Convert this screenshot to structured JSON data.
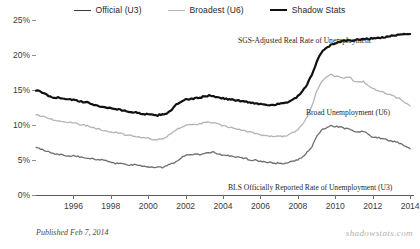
{
  "legend": {
    "items": [
      {
        "label": "Official (U3)",
        "color": "#3a3a3a",
        "key": "u3"
      },
      {
        "label": "Broadest (U6)",
        "color": "#b4b4b4",
        "key": "u6"
      },
      {
        "label": "Shadow Stats",
        "color": "#111111",
        "key": "sgs"
      }
    ]
  },
  "annotations": {
    "sgs": "SGS-Adjusted Real Rate of Unemployment",
    "u6": "Broad Unemployment (U6)",
    "u3": "BLS Officially Reported Rate of Unemployment (U3)"
  },
  "footer": {
    "published": "Published  Feb  7, 2014",
    "watermark": "shadowstats.com"
  },
  "chart_data": {
    "type": "line",
    "title": "",
    "xlabel": "",
    "ylabel": "",
    "grid": false,
    "legend_position": "top-center",
    "xlim": [
      1994.0,
      2014.1
    ],
    "ylim": [
      0,
      25
    ],
    "ytick_values": [
      0,
      5,
      10,
      15,
      20,
      25
    ],
    "ytick_labels": [
      "0%",
      "5%",
      "10%",
      "15%",
      "20%",
      "25%"
    ],
    "xtick_values": [
      1996,
      1998,
      2000,
      2002,
      2004,
      2006,
      2008,
      2010,
      2012,
      2014
    ],
    "xtick_labels": [
      "1996",
      "1998",
      "2000",
      "2002",
      "2004",
      "2006",
      "2008",
      "2010",
      "2012",
      "2014"
    ],
    "x": [
      1994.0,
      1994.25,
      1994.5,
      1994.75,
      1995.0,
      1995.25,
      1995.5,
      1995.75,
      1996.0,
      1996.25,
      1996.5,
      1996.75,
      1997.0,
      1997.25,
      1997.5,
      1997.75,
      1998.0,
      1998.25,
      1998.5,
      1998.75,
      1999.0,
      1999.25,
      1999.5,
      1999.75,
      2000.0,
      2000.25,
      2000.5,
      2000.75,
      2001.0,
      2001.25,
      2001.5,
      2001.75,
      2002.0,
      2002.25,
      2002.5,
      2002.75,
      2003.0,
      2003.25,
      2003.5,
      2003.75,
      2004.0,
      2004.25,
      2004.5,
      2004.75,
      2005.0,
      2005.25,
      2005.5,
      2005.75,
      2006.0,
      2006.25,
      2006.5,
      2006.75,
      2007.0,
      2007.25,
      2007.5,
      2007.75,
      2008.0,
      2008.25,
      2008.5,
      2008.75,
      2009.0,
      2009.25,
      2009.5,
      2009.75,
      2010.0,
      2010.25,
      2010.5,
      2010.75,
      2011.0,
      2011.25,
      2011.5,
      2011.75,
      2012.0,
      2012.25,
      2012.5,
      2012.75,
      2013.0,
      2013.25,
      2013.5,
      2013.75,
      2014.0
    ],
    "series": [
      {
        "name": "Shadow Stats",
        "label": "SGS-Adjusted Real Rate of Unemployment",
        "color": "#111111",
        "width": 2.2,
        "values": [
          15.0,
          14.7,
          14.4,
          14.1,
          13.9,
          13.9,
          13.8,
          13.7,
          13.6,
          13.4,
          13.3,
          13.2,
          13.0,
          12.8,
          12.6,
          12.5,
          12.4,
          12.3,
          12.2,
          12.0,
          11.9,
          11.8,
          11.7,
          11.6,
          11.5,
          11.4,
          11.4,
          11.5,
          11.7,
          12.2,
          12.9,
          13.3,
          13.6,
          13.7,
          13.8,
          13.9,
          14.1,
          14.2,
          14.1,
          14.0,
          13.8,
          13.7,
          13.6,
          13.5,
          13.4,
          13.3,
          13.2,
          13.1,
          13.0,
          12.9,
          12.9,
          12.9,
          13.0,
          13.1,
          13.3,
          13.6,
          14.1,
          14.8,
          15.8,
          17.2,
          19.0,
          20.3,
          21.0,
          21.4,
          21.7,
          21.9,
          22.0,
          22.1,
          22.1,
          22.2,
          22.3,
          22.3,
          22.4,
          22.4,
          22.5,
          22.6,
          22.7,
          22.8,
          22.9,
          23.0,
          23.0
        ]
      },
      {
        "name": "Broadest (U6)",
        "label": "Broad Unemployment (U6)",
        "color": "#b4b4b4",
        "width": 1.3,
        "values": [
          11.5,
          11.3,
          11.1,
          10.9,
          10.7,
          10.6,
          10.5,
          10.4,
          10.3,
          10.1,
          10.0,
          9.9,
          9.7,
          9.5,
          9.3,
          9.2,
          9.0,
          8.9,
          8.8,
          8.6,
          8.5,
          8.4,
          8.3,
          8.2,
          8.1,
          7.9,
          7.9,
          8.0,
          8.3,
          8.9,
          9.4,
          9.7,
          9.9,
          10.0,
          10.1,
          10.2,
          10.3,
          10.4,
          10.3,
          10.1,
          9.9,
          9.7,
          9.6,
          9.4,
          9.2,
          9.1,
          9.0,
          8.8,
          8.6,
          8.5,
          8.4,
          8.3,
          8.4,
          8.4,
          8.6,
          8.9,
          9.4,
          10.1,
          11.2,
          12.7,
          14.8,
          16.2,
          16.8,
          17.2,
          17.0,
          16.9,
          16.7,
          16.9,
          16.2,
          16.2,
          16.2,
          15.6,
          15.2,
          14.9,
          14.8,
          14.4,
          14.3,
          13.9,
          13.7,
          13.1,
          12.7
        ]
      },
      {
        "name": "Official (U3)",
        "label": "BLS Officially Reported Rate of Unemployment (U3)",
        "color": "#6e6e6e",
        "width": 1.3,
        "values": [
          6.8,
          6.6,
          6.3,
          6.1,
          5.9,
          5.8,
          5.7,
          5.6,
          5.6,
          5.5,
          5.4,
          5.3,
          5.2,
          5.1,
          5.0,
          4.9,
          4.7,
          4.5,
          4.5,
          4.4,
          4.3,
          4.3,
          4.2,
          4.1,
          4.0,
          4.0,
          4.0,
          3.9,
          4.2,
          4.5,
          4.8,
          5.3,
          5.7,
          5.8,
          5.8,
          5.8,
          5.9,
          6.1,
          6.1,
          5.9,
          5.7,
          5.6,
          5.5,
          5.4,
          5.3,
          5.2,
          5.0,
          5.0,
          4.8,
          4.7,
          4.7,
          4.5,
          4.6,
          4.5,
          4.7,
          4.8,
          5.0,
          5.4,
          6.1,
          6.9,
          8.3,
          9.3,
          9.6,
          9.9,
          9.8,
          9.7,
          9.5,
          9.5,
          9.0,
          9.0,
          9.1,
          8.7,
          8.3,
          8.2,
          8.1,
          7.9,
          7.7,
          7.6,
          7.3,
          7.0,
          6.6
        ]
      }
    ]
  }
}
